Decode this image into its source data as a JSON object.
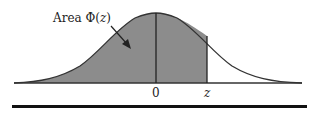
{
  "figure": {
    "area_label_prefix": "Area ",
    "area_label_symbol": "Φ(",
    "area_label_var": "z",
    "area_label_close": ")",
    "axis_zero_label": "0",
    "axis_z_label": "z",
    "colors": {
      "shaded_area": "#8c8c8c",
      "curve": "#333333",
      "background": "#ffffff"
    }
  }
}
